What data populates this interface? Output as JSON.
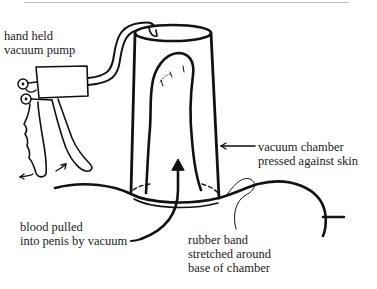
{
  "diagram": {
    "type": "labeled illustration",
    "colors": {
      "line": "#111111",
      "text": "#1a1a1a",
      "background": "#ffffff"
    },
    "labels": {
      "pump": {
        "lines": [
          "hand held",
          "vacuum pump"
        ]
      },
      "chamber": {
        "lines": [
          "vacuum chamber",
          "pressed against skin"
        ]
      },
      "blood": {
        "lines": [
          "blood pulled",
          "into penis by vacuum"
        ]
      },
      "band": {
        "lines": [
          "rubber band",
          "stretched around",
          "base of chamber"
        ]
      }
    },
    "components": [
      {
        "name": "hand-held-vacuum-pump",
        "icon": "pump-icon"
      },
      {
        "name": "connecting-tube",
        "icon": "tube-icon"
      },
      {
        "name": "vacuum-chamber",
        "icon": "cylinder-icon"
      },
      {
        "name": "penis-outline",
        "icon": "anatomy-icon"
      },
      {
        "name": "rubber-band",
        "icon": "band-icon"
      },
      {
        "name": "skin-line",
        "icon": "curve-icon"
      },
      {
        "name": "blood-flow-arrow",
        "icon": "arrow-up-icon"
      },
      {
        "name": "pump-motion-arrows",
        "icon": "double-arrow-icon"
      }
    ]
  }
}
